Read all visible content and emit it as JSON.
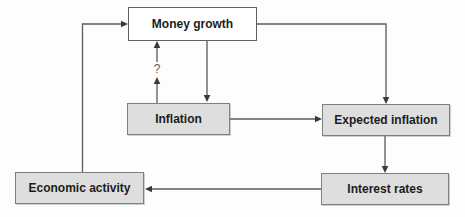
{
  "diagram": {
    "type": "flowchart",
    "nodes": [
      {
        "id": "money-growth",
        "label": "Money growth",
        "style": "white"
      },
      {
        "id": "inflation",
        "label": "Inflation",
        "style": "gray"
      },
      {
        "id": "expected-inflation",
        "label": "Expected inflation",
        "style": "gray"
      },
      {
        "id": "interest-rates",
        "label": "Interest rates",
        "style": "gray"
      },
      {
        "id": "economic-activity",
        "label": "Economic activity",
        "style": "gray"
      }
    ],
    "edges": [
      {
        "from": "economic-activity",
        "to": "money-growth",
        "label": ""
      },
      {
        "from": "money-growth",
        "to": "inflation",
        "label": ""
      },
      {
        "from": "inflation",
        "to": "money-growth",
        "label": "?"
      },
      {
        "from": "money-growth",
        "to": "expected-inflation",
        "label": ""
      },
      {
        "from": "inflation",
        "to": "expected-inflation",
        "label": ""
      },
      {
        "from": "expected-inflation",
        "to": "interest-rates",
        "label": ""
      },
      {
        "from": "interest-rates",
        "to": "economic-activity",
        "label": ""
      }
    ],
    "annotations": {
      "question_mark": "?"
    },
    "colors": {
      "node_fill_gray": "#dedede",
      "node_fill_white": "#ffffff",
      "node_border": "#7f7f7f",
      "connector": "#5a5a5a",
      "arrowhead": "#3a3a3a",
      "text": "#1c1c1c",
      "background": "#fdfdfd"
    }
  }
}
